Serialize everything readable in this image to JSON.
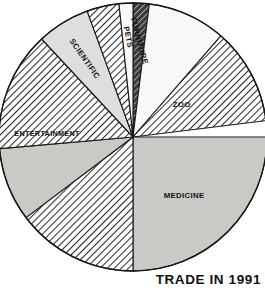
{
  "caption": "TRADE IN 1991",
  "chart_data": {
    "type": "pie",
    "title": "TRADE IN 1991",
    "subtitle": "",
    "xlabel": "",
    "ylabel": "",
    "legend": "none",
    "grid": false,
    "total_degrees": 360,
    "start_angle_deg": 0,
    "direction": "clockwise",
    "center": {
      "x": 133,
      "y": 137
    },
    "radius": 134,
    "labels": [
      "FURNITURE",
      "",
      "ZOO",
      "MEDICINE",
      "",
      "",
      "ENTERTAINMENT",
      "SCIENTIFIC",
      "",
      "PETS"
    ],
    "values": [
      7,
      34,
      42,
      90,
      53,
      32,
      52,
      23,
      14,
      13
    ],
    "slices": [
      {
        "name": "FURNITURE",
        "label": "FURNITURE",
        "start_deg": 0,
        "end_deg": 7,
        "value": 7,
        "percent": 1.9,
        "fill": "hatch-dark",
        "color": "#3a3a3a",
        "label_angle_deg": 3.5,
        "label_radius": 96,
        "label_rotation_deg": 75,
        "label_color": "#0f0f0f"
      },
      {
        "name": "slice-white-upper",
        "label": "",
        "start_deg": 7,
        "end_deg": 41,
        "value": 34,
        "percent": 9.4,
        "fill": "solid-white",
        "color": "#f7f7f5",
        "label_angle_deg": 24,
        "label_radius": 0,
        "label_rotation_deg": 0,
        "label_color": "#0f0f0f"
      },
      {
        "name": "ZOO",
        "label": "ZOO",
        "start_deg": 41,
        "end_deg": 83,
        "value": 42,
        "percent": 11.7,
        "fill": "hatch-light",
        "color": "#cfcfcf",
        "label_angle_deg": 57,
        "label_radius": 58,
        "label_rotation_deg": 0,
        "label_color": "#0f0f0f"
      },
      {
        "name": "MEDICINE",
        "label": "MEDICINE",
        "start_deg": 90,
        "end_deg": 180,
        "value": 90,
        "percent": 25.0,
        "fill": "solid-gray",
        "color": "#c8c8c6",
        "label_angle_deg": 139,
        "label_radius": 78,
        "label_rotation_deg": 0,
        "label_color": "#0f0f0f"
      },
      {
        "name": "slice-hatch-lower-left",
        "label": "",
        "start_deg": 180,
        "end_deg": 233,
        "value": 53,
        "percent": 14.7,
        "fill": "hatch-light",
        "color": "#cfcfcf",
        "label_angle_deg": 206,
        "label_radius": 0,
        "label_rotation_deg": 0,
        "label_color": "#0f0f0f"
      },
      {
        "name": "slice-gray-left",
        "label": "",
        "start_deg": 233,
        "end_deg": 265,
        "value": 32,
        "percent": 8.9,
        "fill": "solid-gray",
        "color": "#cdcdc9",
        "label_angle_deg": 249,
        "label_radius": 0,
        "label_rotation_deg": 0,
        "label_color": "#0f0f0f"
      },
      {
        "name": "ENTERTAINMENT",
        "label": "ENTERTAINMENT",
        "start_deg": 265,
        "end_deg": 317,
        "value": 52,
        "percent": 14.4,
        "fill": "hatch-light",
        "color": "#cfcfcf",
        "label_angle_deg": 272,
        "label_radius": 86,
        "label_rotation_deg": 0,
        "label_color": "#0f0f0f"
      },
      {
        "name": "SCIENTIFIC",
        "label": "SCIENTIFIC",
        "start_deg": 317,
        "end_deg": 340,
        "value": 23,
        "percent": 6.4,
        "fill": "solid-light",
        "color": "#dedede",
        "label_angle_deg": 328,
        "label_radius": 92,
        "label_rotation_deg": 55,
        "label_color": "#0f0f0f"
      },
      {
        "name": "slice-hatch-top",
        "label": "",
        "start_deg": 340,
        "end_deg": 354,
        "value": 14,
        "percent": 3.9,
        "fill": "hatch-light",
        "color": "#cfcfcf",
        "label_angle_deg": 347,
        "label_radius": 0,
        "label_rotation_deg": 0,
        "label_color": "#0f0f0f"
      },
      {
        "name": "PETS",
        "label": "PETS",
        "start_deg": 354,
        "end_deg": 360,
        "value": 13,
        "percent": 3.6,
        "fill": "solid-white",
        "color": "#f7f7f5",
        "label_angle_deg": 357,
        "label_radius": 100,
        "label_rotation_deg": 78,
        "label_color": "#0f0f0f"
      }
    ]
  }
}
